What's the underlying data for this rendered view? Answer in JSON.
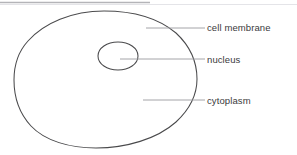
{
  "diagram": {
    "background_color": "#ffffff",
    "stroke_color": "#4a4a4c",
    "text_color": "#3a3a3c",
    "top_rule_color": "#b9b9bd",
    "leader_line_color": "#9a9a9e",
    "labels": [
      {
        "id": "cell-membrane",
        "text": "cell membrane"
      },
      {
        "id": "nucleus",
        "text": "nucleus"
      },
      {
        "id": "cytoplasm",
        "text": "cytoplasm"
      }
    ],
    "parts": {
      "cell_membrane": "cell membrane",
      "nucleus": "nucleus",
      "cytoplasm": "cytoplasm"
    }
  }
}
